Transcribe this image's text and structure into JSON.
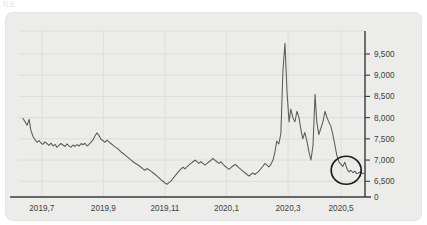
{
  "clipped_header_text": "차트",
  "card": {
    "background_color": "#ececea",
    "plot_background_color": "#ececea"
  },
  "chart_data": {
    "type": "line",
    "title": "",
    "subtitle": "",
    "xlabel": "",
    "ylabel": "",
    "grid": true,
    "legend": "none",
    "line_color": "#5a5a5a",
    "axis_color": "#3a3a3a",
    "ylim": [
      6200,
      9900
    ],
    "y_ticks": [
      6500,
      7000,
      7500,
      8000,
      8500,
      9000,
      9500
    ],
    "y_tick_labels": [
      "6,500",
      "7,000",
      "7,500",
      "8,000",
      "8,500",
      "9,000",
      "9,500"
    ],
    "y_zero_label": "0",
    "x_tick_labels": [
      "2019,7",
      "2019,9",
      "2019,11",
      "2020,1",
      "2020,3",
      "2020,5"
    ],
    "x_tick_positions": [
      0.055,
      0.235,
      0.415,
      0.595,
      0.775,
      0.93
    ],
    "annotation": {
      "type": "ellipse",
      "label": "",
      "center_x_frac": 0.945,
      "center_y_value": 6760,
      "rx_px": 15,
      "ry_px": 14
    },
    "x": [
      0.0,
      0.006,
      0.012,
      0.018,
      0.023,
      0.029,
      0.035,
      0.041,
      0.047,
      0.053,
      0.058,
      0.064,
      0.07,
      0.076,
      0.082,
      0.088,
      0.094,
      0.099,
      0.105,
      0.111,
      0.117,
      0.123,
      0.129,
      0.134,
      0.14,
      0.146,
      0.152,
      0.158,
      0.164,
      0.17,
      0.175,
      0.181,
      0.187,
      0.193,
      0.199,
      0.205,
      0.21,
      0.216,
      0.222,
      0.228,
      0.234,
      0.24,
      0.246,
      0.251,
      0.257,
      0.263,
      0.269,
      0.275,
      0.281,
      0.286,
      0.292,
      0.298,
      0.304,
      0.31,
      0.316,
      0.322,
      0.327,
      0.333,
      0.339,
      0.345,
      0.351,
      0.357,
      0.362,
      0.368,
      0.374,
      0.38,
      0.386,
      0.392,
      0.398,
      0.403,
      0.409,
      0.415,
      0.421,
      0.427,
      0.433,
      0.438,
      0.444,
      0.45,
      0.456,
      0.462,
      0.468,
      0.474,
      0.479,
      0.485,
      0.491,
      0.497,
      0.503,
      0.509,
      0.514,
      0.52,
      0.526,
      0.532,
      0.538,
      0.544,
      0.55,
      0.555,
      0.561,
      0.567,
      0.573,
      0.579,
      0.585,
      0.59,
      0.596,
      0.602,
      0.608,
      0.614,
      0.62,
      0.626,
      0.631,
      0.637,
      0.643,
      0.649,
      0.655,
      0.661,
      0.666,
      0.672,
      0.678,
      0.684,
      0.69,
      0.696,
      0.702,
      0.707,
      0.713,
      0.719,
      0.725,
      0.731,
      0.737,
      0.742,
      0.748,
      0.754,
      0.76,
      0.766,
      0.772,
      0.778,
      0.783,
      0.789,
      0.795,
      0.801,
      0.807,
      0.813,
      0.818,
      0.824,
      0.83,
      0.836,
      0.842,
      0.848,
      0.854,
      0.859,
      0.865,
      0.871,
      0.877,
      0.883,
      0.889,
      0.894,
      0.9,
      0.906,
      0.912,
      0.918,
      0.924,
      0.93,
      0.935,
      0.941,
      0.947,
      0.953,
      0.959,
      0.965,
      0.97,
      0.976,
      0.982,
      0.988,
      0.994,
      1.0
    ],
    "values": [
      7980,
      7905,
      7820,
      7960,
      7700,
      7560,
      7480,
      7420,
      7460,
      7395,
      7370,
      7430,
      7390,
      7345,
      7400,
      7330,
      7370,
      7300,
      7345,
      7390,
      7355,
      7320,
      7380,
      7335,
      7300,
      7355,
      7320,
      7365,
      7330,
      7390,
      7360,
      7395,
      7330,
      7370,
      7420,
      7480,
      7560,
      7640,
      7580,
      7490,
      7455,
      7420,
      7470,
      7430,
      7390,
      7350,
      7310,
      7280,
      7240,
      7200,
      7160,
      7120,
      7080,
      7040,
      7000,
      6960,
      6930,
      6900,
      6870,
      6830,
      6790,
      6760,
      6800,
      6770,
      6740,
      6700,
      6660,
      6620,
      6580,
      6540,
      6500,
      6460,
      6430,
      6470,
      6510,
      6560,
      6620,
      6680,
      6740,
      6790,
      6830,
      6790,
      6840,
      6880,
      6920,
      6960,
      7000,
      6960,
      6920,
      6960,
      6920,
      6880,
      6920,
      6960,
      7000,
      7040,
      7000,
      6960,
      6920,
      6960,
      6900,
      6860,
      6820,
      6780,
      6820,
      6860,
      6900,
      6860,
      6820,
      6780,
      6740,
      6700,
      6660,
      6620,
      6660,
      6700,
      6660,
      6700,
      6740,
      6800,
      6860,
      6920,
      6880,
      6840,
      6900,
      7000,
      7200,
      7450,
      7380,
      7620,
      9100,
      9750,
      8600,
      7900,
      8200,
      8000,
      7900,
      8150,
      8000,
      7700,
      7500,
      7650,
      7450,
      7200,
      7000,
      7350,
      8550,
      7900,
      7600,
      7750,
      7900,
      8150,
      8000,
      7900,
      7800,
      7600,
      7350,
      7100,
      6950,
      6900,
      6850,
      6950,
      6800,
      6720,
      6760,
      6700,
      6740,
      6680,
      6700,
      6720,
      6680,
      6700
    ]
  }
}
